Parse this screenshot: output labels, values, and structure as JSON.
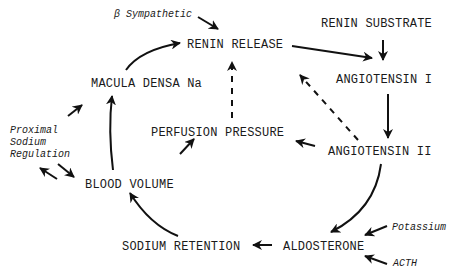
{
  "diagram": {
    "nodes": {
      "renin_release": "RENIN RELEASE",
      "renin_substrate": "RENIN SUBSTRATE",
      "angiotensin_1": "ANGIOTENSIN I",
      "angiotensin_2": "ANGIOTENSIN II",
      "aldosterone": "ALDOSTERONE",
      "sodium_retention": "SODIUM RETENTION",
      "blood_volume": "BLOOD VOLUME",
      "macula_densa": "MACULA DENSA Na",
      "perfusion_pressure": "PERFUSION PRESSURE"
    },
    "modifiers": {
      "beta_sympathetic": "β Sympathetic",
      "proximal_line1": "Proximal",
      "proximal_line2": "Sodium",
      "proximal_line3": "Regulation",
      "potassium": "Potassium",
      "acth": "ACTH"
    },
    "edges": [
      {
        "from": "beta_sympathetic",
        "to": "renin_release",
        "style": "solid"
      },
      {
        "from": "renin_release",
        "to": "angiotensin_1",
        "style": "solid"
      },
      {
        "from": "renin_substrate",
        "to": "angiotensin_1",
        "style": "solid"
      },
      {
        "from": "angiotensin_1",
        "to": "angiotensin_2",
        "style": "solid"
      },
      {
        "from": "angiotensin_2",
        "to": "renin_release",
        "style": "dashed"
      },
      {
        "from": "angiotensin_2",
        "to": "perfusion_pressure",
        "style": "solid"
      },
      {
        "from": "angiotensin_2",
        "to": "aldosterone",
        "style": "solid"
      },
      {
        "from": "potassium",
        "to": "aldosterone",
        "style": "solid"
      },
      {
        "from": "acth",
        "to": "aldosterone",
        "style": "solid"
      },
      {
        "from": "aldosterone",
        "to": "sodium_retention",
        "style": "solid"
      },
      {
        "from": "sodium_retention",
        "to": "blood_volume",
        "style": "solid"
      },
      {
        "from": "blood_volume",
        "to": "macula_densa",
        "style": "solid"
      },
      {
        "from": "blood_volume",
        "to": "perfusion_pressure",
        "style": "solid"
      },
      {
        "from": "blood_volume",
        "to": "proximal_sodium_regulation",
        "style": "solid"
      },
      {
        "from": "proximal_sodium_regulation",
        "to": "blood_volume",
        "style": "solid"
      },
      {
        "from": "proximal_sodium_regulation",
        "to": "macula_densa",
        "style": "solid"
      },
      {
        "from": "macula_densa",
        "to": "renin_release",
        "style": "solid"
      },
      {
        "from": "perfusion_pressure",
        "to": "renin_release",
        "style": "dashed"
      }
    ]
  }
}
